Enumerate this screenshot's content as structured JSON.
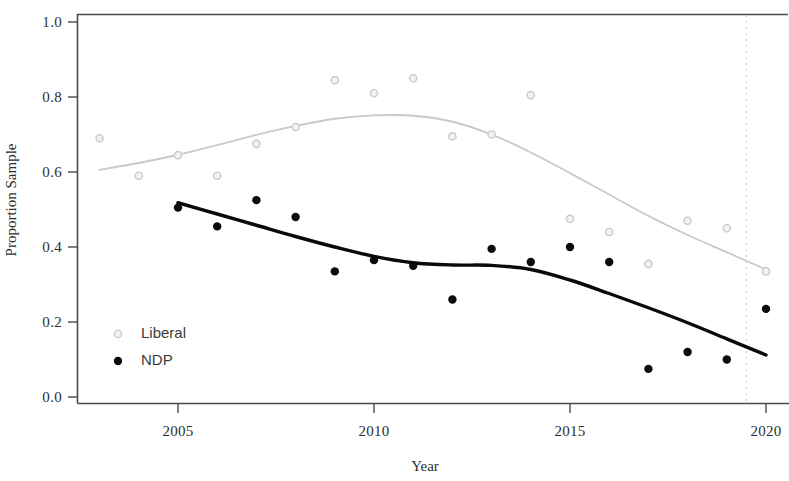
{
  "chart_data": {
    "type": "scatter",
    "title": "",
    "xlabel": "Year",
    "ylabel": "Proportion Sample",
    "xlim": [
      2002.3,
      2020.6
    ],
    "ylim": [
      0.0,
      1.04
    ],
    "xticks": [
      2005,
      2010,
      2015,
      2020
    ],
    "xtick_labels": [
      "2005",
      "2010",
      "2015",
      "2020"
    ],
    "yticks": [
      0.0,
      0.2,
      0.4,
      0.6,
      0.8,
      1.0
    ],
    "ytick_labels": [
      "0.0",
      "0.2",
      "0.4",
      "0.6",
      "0.8",
      "1.0"
    ],
    "grid": false,
    "legend_position": "bottom-left",
    "reference_line": {
      "x": 2019.5,
      "style": "dashed",
      "color": "#cfcfcf"
    },
    "series": [
      {
        "name": "Liberal",
        "color": "#c9c9c9",
        "marker": "open-circle",
        "points": [
          {
            "x": 2003,
            "y": 0.69
          },
          {
            "x": 2004,
            "y": 0.59
          },
          {
            "x": 2005,
            "y": 0.645
          },
          {
            "x": 2006,
            "y": 0.59
          },
          {
            "x": 2007,
            "y": 0.675
          },
          {
            "x": 2008,
            "y": 0.72
          },
          {
            "x": 2009,
            "y": 0.845
          },
          {
            "x": 2010,
            "y": 0.81
          },
          {
            "x": 2011,
            "y": 0.85
          },
          {
            "x": 2012,
            "y": 0.695
          },
          {
            "x": 2013,
            "y": 0.7
          },
          {
            "x": 2014,
            "y": 0.805
          },
          {
            "x": 2015,
            "y": 0.475
          },
          {
            "x": 2016,
            "y": 0.44
          },
          {
            "x": 2017,
            "y": 0.355
          },
          {
            "x": 2018,
            "y": 0.47
          },
          {
            "x": 2019,
            "y": 0.45
          },
          {
            "x": 2020,
            "y": 0.335
          }
        ],
        "trend": [
          {
            "x": 2003.0,
            "y": 0.606
          },
          {
            "x": 2004.0,
            "y": 0.624
          },
          {
            "x": 2005.0,
            "y": 0.646
          },
          {
            "x": 2006.0,
            "y": 0.672
          },
          {
            "x": 2007.0,
            "y": 0.699
          },
          {
            "x": 2008.0,
            "y": 0.723
          },
          {
            "x": 2009.0,
            "y": 0.742
          },
          {
            "x": 2010.0,
            "y": 0.751
          },
          {
            "x": 2011.0,
            "y": 0.75
          },
          {
            "x": 2012.0,
            "y": 0.734
          },
          {
            "x": 2013.0,
            "y": 0.7
          },
          {
            "x": 2014.0,
            "y": 0.652
          },
          {
            "x": 2015.0,
            "y": 0.597
          },
          {
            "x": 2016.0,
            "y": 0.54
          },
          {
            "x": 2017.0,
            "y": 0.483
          },
          {
            "x": 2018.0,
            "y": 0.432
          },
          {
            "x": 2019.0,
            "y": 0.386
          },
          {
            "x": 2020.0,
            "y": 0.34
          }
        ]
      },
      {
        "name": "NDP",
        "color": "#0a0a0a",
        "marker": "filled-circle",
        "points": [
          {
            "x": 2005,
            "y": 0.505
          },
          {
            "x": 2006,
            "y": 0.455
          },
          {
            "x": 2007,
            "y": 0.525
          },
          {
            "x": 2008,
            "y": 0.48
          },
          {
            "x": 2009,
            "y": 0.335
          },
          {
            "x": 2010,
            "y": 0.365
          },
          {
            "x": 2011,
            "y": 0.35
          },
          {
            "x": 2012,
            "y": 0.26
          },
          {
            "x": 2013,
            "y": 0.395
          },
          {
            "x": 2014,
            "y": 0.36
          },
          {
            "x": 2015,
            "y": 0.4
          },
          {
            "x": 2016,
            "y": 0.36
          },
          {
            "x": 2017,
            "y": 0.075
          },
          {
            "x": 2018,
            "y": 0.12
          },
          {
            "x": 2019,
            "y": 0.1
          },
          {
            "x": 2020,
            "y": 0.235
          }
        ],
        "trend": [
          {
            "x": 2005.0,
            "y": 0.518
          },
          {
            "x": 2006.0,
            "y": 0.488
          },
          {
            "x": 2007.0,
            "y": 0.458
          },
          {
            "x": 2008.0,
            "y": 0.428
          },
          {
            "x": 2009.0,
            "y": 0.4
          },
          {
            "x": 2010.0,
            "y": 0.375
          },
          {
            "x": 2011.0,
            "y": 0.358
          },
          {
            "x": 2012.0,
            "y": 0.352
          },
          {
            "x": 2013.0,
            "y": 0.351
          },
          {
            "x": 2014.0,
            "y": 0.34
          },
          {
            "x": 2015.0,
            "y": 0.312
          },
          {
            "x": 2016.0,
            "y": 0.276
          },
          {
            "x": 2017.0,
            "y": 0.238
          },
          {
            "x": 2018.0,
            "y": 0.198
          },
          {
            "x": 2019.0,
            "y": 0.155
          },
          {
            "x": 2020.0,
            "y": 0.112
          }
        ]
      }
    ],
    "legend": [
      {
        "label": "Liberal",
        "color": "#c9c9c9",
        "marker": "open-circle"
      },
      {
        "label": "NDP",
        "color": "#0a0a0a",
        "marker": "filled-circle"
      }
    ]
  }
}
